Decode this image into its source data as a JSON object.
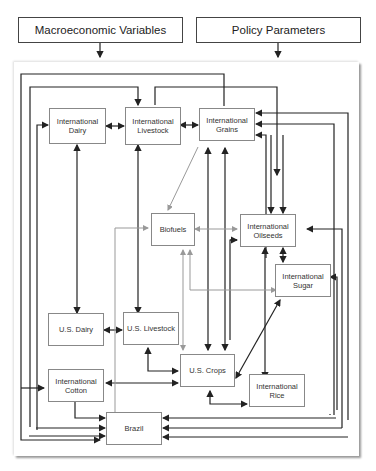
{
  "inputs": {
    "macro": "Macroeconomic Variables",
    "policy": "Policy Parameters"
  },
  "nodes": {
    "intl_dairy": "International\nDairy",
    "intl_livestock": "International\nLivestock",
    "intl_grains": "International\nGrains",
    "biofuels": "Biofuels",
    "intl_oilseeds": "International\nOilseeds",
    "intl_sugar": "International\nSugar",
    "us_dairy": "U.S. Dairy",
    "us_livestock": "U.S. Livestock",
    "us_crops": "U.S. Crops",
    "intl_cotton": "International\nCotton",
    "intl_rice": "International\nRice",
    "brazil": "Brazil"
  },
  "colors": {
    "line": "#222222",
    "gray_line": "#999999",
    "node_border": "#888888"
  }
}
